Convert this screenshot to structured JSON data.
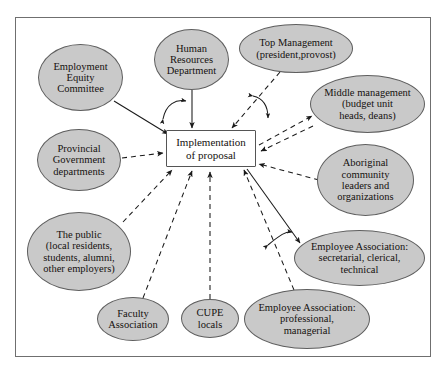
{
  "diagram": {
    "frame": {
      "border_color": "#6f6f6f",
      "background": "#ffffff"
    },
    "styles": {
      "oval_fill": "#c9c9c9",
      "oval_stroke": "#5e5e5e",
      "box_fill": "#ffffff",
      "box_stroke": "#555555",
      "text_color": "#15110f",
      "line_color": "#1a1a1a"
    },
    "center": {
      "id": "implementation-of-proposal",
      "label": "Implementation\nof proposal",
      "shape": "rectangle",
      "x": 166,
      "y": 130,
      "w": 90,
      "h": 37,
      "font_size": 11
    },
    "nodes": [
      {
        "id": "employment-equity-committee",
        "label": "Employment\nEquity\nCommittee",
        "shape": "ellipse",
        "x": 38,
        "y": 44,
        "w": 85,
        "h": 67,
        "font_size": 10.5
      },
      {
        "id": "human-resources-department",
        "label": "Human\nResources\nDepartment",
        "shape": "ellipse",
        "x": 154,
        "y": 29,
        "w": 75,
        "h": 61,
        "font_size": 10.5
      },
      {
        "id": "top-management",
        "label": "Top Management\n(president,provost)",
        "shape": "ellipse",
        "x": 239,
        "y": 24,
        "w": 114,
        "h": 49,
        "font_size": 10.5
      },
      {
        "id": "middle-management",
        "label": "Middle management\n(budget unit\nheads, deans)",
        "shape": "ellipse",
        "x": 310,
        "y": 75,
        "w": 115,
        "h": 58,
        "font_size": 10.5
      },
      {
        "id": "aboriginal-community",
        "label": "Aboriginal\ncommunity\nleaders and\norganizations",
        "shape": "ellipse",
        "x": 317,
        "y": 144,
        "w": 97,
        "h": 72,
        "font_size": 10.5
      },
      {
        "id": "employee-association-secretarial",
        "label": "Employee Association:\nsecretarial, clerical,\ntechnical",
        "shape": "ellipse",
        "x": 294,
        "y": 230,
        "w": 131,
        "h": 56,
        "font_size": 10.5
      },
      {
        "id": "employee-association-professional",
        "label": "Employee Association:\nprofessional,\nmanagerial",
        "shape": "ellipse",
        "x": 244,
        "y": 289,
        "w": 126,
        "h": 60,
        "font_size": 10.5
      },
      {
        "id": "cupe-locals",
        "label": "CUPE\nlocals",
        "shape": "ellipse",
        "x": 181,
        "y": 299,
        "w": 58,
        "h": 39,
        "font_size": 10.5
      },
      {
        "id": "faculty-association",
        "label": "Faculty\nAssociation",
        "shape": "ellipse",
        "x": 97,
        "y": 297,
        "w": 72,
        "h": 44,
        "font_size": 10.5
      },
      {
        "id": "the-public",
        "label": "The public\n(local residents,\nstudents, alumni,\nother employers)",
        "shape": "ellipse",
        "x": 27,
        "y": 212,
        "w": 104,
        "h": 79,
        "font_size": 10.5
      },
      {
        "id": "provincial-government-departments",
        "label": "Provincial\nGovernment\ndepartments",
        "shape": "ellipse",
        "x": 37,
        "y": 129,
        "w": 84,
        "h": 62,
        "font_size": 10.5
      }
    ],
    "connectors": [
      {
        "from": "employment-equity-committee",
        "to": "implementation-of-proposal",
        "style": "solid",
        "arrow": "single"
      },
      {
        "from": "human-resources-department",
        "to": "implementation-of-proposal",
        "style": "solid",
        "arrow": "single"
      },
      {
        "from": "top-management",
        "to": "implementation-of-proposal",
        "style": "dashed",
        "arrow": "single"
      },
      {
        "from": "middle-management",
        "to": "implementation-of-proposal",
        "style": "dashed",
        "arrow": "double"
      },
      {
        "from": "aboriginal-community",
        "to": "implementation-of-proposal",
        "style": "dashed",
        "arrow": "single"
      },
      {
        "from": "employee-association-secretarial",
        "to": "implementation-of-proposal",
        "style": "solid",
        "arrow": "single"
      },
      {
        "from": "employee-association-professional",
        "to": "implementation-of-proposal",
        "style": "dashed",
        "arrow": "single"
      },
      {
        "from": "cupe-locals",
        "to": "implementation-of-proposal",
        "style": "dashed",
        "arrow": "single"
      },
      {
        "from": "faculty-association",
        "to": "implementation-of-proposal",
        "style": "dashed",
        "arrow": "single"
      },
      {
        "from": "the-public",
        "to": "implementation-of-proposal",
        "style": "dashed",
        "arrow": "single"
      },
      {
        "from": "provincial-government-departments",
        "to": "implementation-of-proposal",
        "style": "dashed",
        "arrow": "single"
      }
    ]
  }
}
